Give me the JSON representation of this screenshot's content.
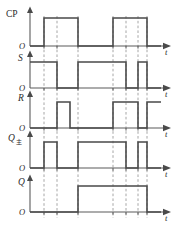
{
  "figure": {
    "kind": "digital-timing-diagram",
    "origin_label": "O",
    "time_axis_label": "t"
  },
  "chart_data": {
    "type": "line",
    "title": "",
    "xlabel": "t",
    "ylabel": "",
    "grid": "vertical-dashed",
    "legend": "none",
    "xlim": [
      30,
      160
    ],
    "ylim": [
      0,
      1
    ],
    "guide_lines": [
      44,
      57,
      78,
      113,
      126,
      138,
      147
    ],
    "series": [
      {
        "name": "CP",
        "label": "CP",
        "subscript": "",
        "baseline_label": "O",
        "axis_label": "t",
        "levels": [
          0,
          1
        ],
        "transitions": [
          {
            "x": 30,
            "level": 0
          },
          {
            "x": 44,
            "level": 1
          },
          {
            "x": 78,
            "level": 0
          },
          {
            "x": 113,
            "level": 1
          },
          {
            "x": 147,
            "level": 0
          },
          {
            "x": 158,
            "level": 0
          }
        ]
      },
      {
        "name": "S",
        "label": "S",
        "subscript": "",
        "baseline_label": "O",
        "axis_label": "t",
        "levels": [
          0,
          1
        ],
        "transitions": [
          {
            "x": 30,
            "level": 1
          },
          {
            "x": 57,
            "level": 0
          },
          {
            "x": 78,
            "level": 1
          },
          {
            "x": 126,
            "level": 0
          },
          {
            "x": 138,
            "level": 1
          },
          {
            "x": 147,
            "level": 0
          },
          {
            "x": 158,
            "level": 0
          }
        ]
      },
      {
        "name": "R",
        "label": "R",
        "subscript": "",
        "baseline_label": "O",
        "axis_label": "t",
        "levels": [
          0,
          1
        ],
        "transitions": [
          {
            "x": 30,
            "level": 0
          },
          {
            "x": 57,
            "level": 1
          },
          {
            "x": 70,
            "level": 0
          },
          {
            "x": 113,
            "level": 1
          },
          {
            "x": 138,
            "level": 0
          },
          {
            "x": 147,
            "level": 1
          },
          {
            "x": 158,
            "level": 1
          }
        ]
      },
      {
        "name": "Q_master",
        "label": "Q",
        "subscript": "主",
        "baseline_label": "O",
        "axis_label": "t",
        "levels": [
          0,
          1
        ],
        "transitions": [
          {
            "x": 30,
            "level": 0
          },
          {
            "x": 44,
            "level": 1
          },
          {
            "x": 57,
            "level": 0
          },
          {
            "x": 78,
            "level": 1
          },
          {
            "x": 126,
            "level": 0
          },
          {
            "x": 138,
            "level": 1
          },
          {
            "x": 147,
            "level": 0
          },
          {
            "x": 158,
            "level": 0
          }
        ]
      },
      {
        "name": "Q",
        "label": "Q",
        "subscript": "",
        "baseline_label": "O",
        "axis_label": "t",
        "levels": [
          0,
          1
        ],
        "transitions": [
          {
            "x": 30,
            "level": 0
          },
          {
            "x": 78,
            "level": 1
          },
          {
            "x": 147,
            "level": 0
          },
          {
            "x": 158,
            "level": 0
          }
        ]
      }
    ]
  },
  "colors": {
    "waveform": "#4a4a4a",
    "axis": "#5a5a5a",
    "guide": "#8f8f8f",
    "text": "#2b2b2b",
    "background": "#ffffff"
  }
}
